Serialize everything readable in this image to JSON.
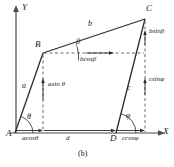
{
  "figure": {
    "caption": "(b)",
    "axes": {
      "x_label": "X",
      "y_label": "Y"
    },
    "points": [
      {
        "id": "A",
        "label": "A",
        "x": 14,
        "y": 133
      },
      {
        "id": "B",
        "label": "B",
        "x": 43,
        "y": 51
      },
      {
        "id": "C",
        "label": "C",
        "x": 145,
        "y": 16
      },
      {
        "id": "D",
        "label": "D",
        "x": 116,
        "y": 133
      }
    ],
    "vectors": [
      {
        "id": "a",
        "label": "a",
        "from": "A",
        "to": "B"
      },
      {
        "id": "b",
        "label": "b",
        "from": "B",
        "to": "C"
      },
      {
        "id": "c",
        "label": "c",
        "from": "D",
        "to": "C"
      }
    ],
    "angles": [
      {
        "id": "theta",
        "label": "θ",
        "at": "A"
      },
      {
        "id": "beta",
        "label": "β",
        "at": "B"
      },
      {
        "id": "phi",
        "label": "φ",
        "at": "D"
      }
    ],
    "components": [
      {
        "id": "acos",
        "label": "acosθ"
      },
      {
        "id": "asin",
        "label": "asin θ"
      },
      {
        "id": "bcos",
        "label": "bcosβ"
      },
      {
        "id": "bsin",
        "label": "bsinβ"
      },
      {
        "id": "ccos",
        "label": "ccosφ"
      },
      {
        "id": "csin",
        "label": "csinφ"
      },
      {
        "id": "d",
        "label": "d"
      }
    ],
    "colors": {
      "stroke": "#2b2b2b",
      "dashed": "#555555",
      "text": "#1a1a1a",
      "background": "#ffffff"
    }
  }
}
